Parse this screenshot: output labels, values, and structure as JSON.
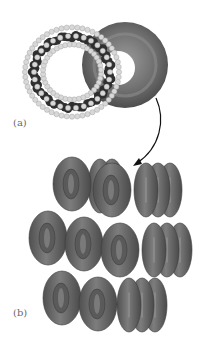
{
  "figure": {
    "panel_a": {
      "label": "(a)",
      "description": "space-filling molecular ring overlaid on torus",
      "torus_color": "#6f6f6f",
      "atom_dark_color": "#2f2f2f",
      "atom_light_color": "#d8d8d8"
    },
    "arrow": {
      "description": "curved arrow from torus in (a) to stacked tori in (b)",
      "color": "#111111"
    },
    "panel_b": {
      "label": "(b)",
      "description": "stacked columns of tori",
      "rows": [
        {
          "columns_front": 2,
          "depth": 4
        },
        {
          "columns_front": 3,
          "depth": 4
        },
        {
          "columns_front": 2,
          "depth": 4
        }
      ],
      "torus_color": "#6a6a6a"
    }
  }
}
